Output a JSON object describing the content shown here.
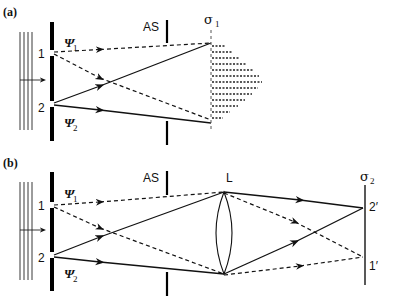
{
  "panel_a": {
    "label": "(a)",
    "slit1_label": "1",
    "slit2_label": "2",
    "psi1": "Ψ",
    "psi1_sub": "1",
    "psi2": "Ψ",
    "psi2_sub": "2",
    "aperture_label": "AS",
    "screen_label": "σ",
    "screen_sub": "1"
  },
  "panel_b": {
    "label": "(b)",
    "slit1_label": "1",
    "slit2_label": "2",
    "psi1": "Ψ",
    "psi1_sub": "1",
    "psi2": "Ψ",
    "psi2_sub": "2",
    "aperture_label": "AS",
    "lens_label": "L",
    "screen_label": "σ",
    "screen_sub": "2",
    "image2_label": "2′",
    "image1_label": "1′"
  }
}
